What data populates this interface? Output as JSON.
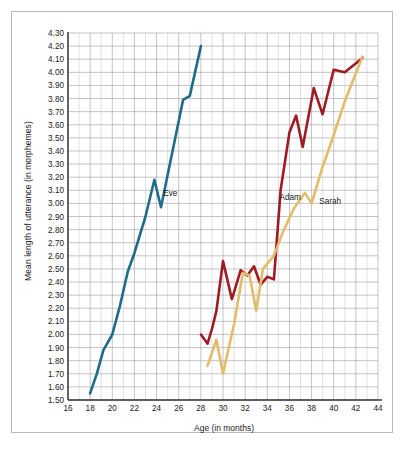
{
  "chart_data": {
    "type": "line",
    "title": "",
    "xlabel": "Age (in months)",
    "ylabel": "Mean length of utterance (in morphemes)",
    "xlim": [
      16,
      44
    ],
    "ylim": [
      1.5,
      4.3
    ],
    "xticks": [
      16,
      18,
      20,
      22,
      24,
      26,
      28,
      30,
      32,
      34,
      36,
      38,
      40,
      42,
      44
    ],
    "yticks": [
      "1.50",
      "1.60",
      "1.70",
      "1.80",
      "1.90",
      "2.00",
      "2.10",
      "2.20",
      "2.30",
      "2.40",
      "2.50",
      "2.60",
      "2.70",
      "2.80",
      "2.90",
      "3.00",
      "3.10",
      "3.20",
      "3.30",
      "3.40",
      "3.50",
      "3.60",
      "3.70",
      "3.80",
      "3.90",
      "4.00",
      "4.10",
      "4.20",
      "4.30"
    ],
    "grid": true,
    "legend_position": "inline-annotations",
    "series": [
      {
        "name": "Eve",
        "color": "#1f6b8c",
        "label_x": 24.6,
        "label_y": 3.07,
        "points": [
          [
            18.0,
            1.55
          ],
          [
            18.6,
            1.7
          ],
          [
            19.2,
            1.88
          ],
          [
            20.0,
            2.0
          ],
          [
            20.7,
            2.22
          ],
          [
            21.4,
            2.48
          ],
          [
            22.0,
            2.62
          ],
          [
            23.0,
            2.9
          ],
          [
            23.8,
            3.18
          ],
          [
            24.4,
            2.97
          ],
          [
            26.4,
            3.79
          ],
          [
            27.0,
            3.82
          ],
          [
            28.0,
            4.2
          ]
        ]
      },
      {
        "name": "Adam",
        "color": "#9e1b24",
        "label_x": 35.1,
        "label_y": 3.04,
        "points": [
          [
            28.0,
            2.0
          ],
          [
            28.6,
            1.93
          ],
          [
            29.0,
            2.04
          ],
          [
            29.4,
            2.18
          ],
          [
            30.0,
            2.56
          ],
          [
            30.8,
            2.27
          ],
          [
            31.6,
            2.49
          ],
          [
            32.2,
            2.45
          ],
          [
            32.8,
            2.52
          ],
          [
            33.4,
            2.38
          ],
          [
            34.0,
            2.44
          ],
          [
            34.6,
            2.42
          ],
          [
            35.2,
            3.1
          ],
          [
            36.0,
            3.54
          ],
          [
            36.6,
            3.67
          ],
          [
            37.2,
            3.43
          ],
          [
            38.2,
            3.88
          ],
          [
            39.0,
            3.68
          ],
          [
            40.0,
            4.02
          ],
          [
            41.0,
            4.0
          ],
          [
            42.6,
            4.11
          ]
        ]
      },
      {
        "name": "Sarah",
        "color": "#e4bb6a",
        "label_x": 38.7,
        "label_y": 3.01,
        "points": [
          [
            28.6,
            1.76
          ],
          [
            29.4,
            1.96
          ],
          [
            30.0,
            1.7
          ],
          [
            31.0,
            2.08
          ],
          [
            31.8,
            2.47
          ],
          [
            32.4,
            2.45
          ],
          [
            33.0,
            2.18
          ],
          [
            33.6,
            2.5
          ],
          [
            34.6,
            2.6
          ],
          [
            35.4,
            2.78
          ],
          [
            36.4,
            2.96
          ],
          [
            37.4,
            3.08
          ],
          [
            38.0,
            3.0
          ],
          [
            39.0,
            3.28
          ],
          [
            40.0,
            3.52
          ],
          [
            41.0,
            3.78
          ],
          [
            42.6,
            4.12
          ]
        ]
      }
    ]
  }
}
